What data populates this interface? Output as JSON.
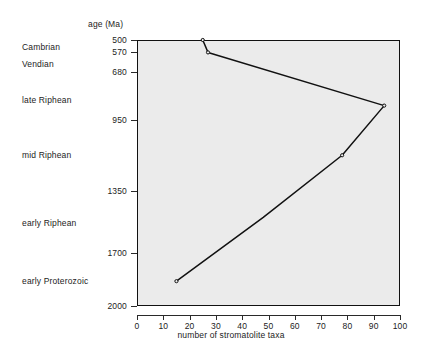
{
  "axes": {
    "y_header": "age (Ma)",
    "x_title": "number of  stromatolite taxa",
    "y_ticks": [
      "500",
      "570",
      "680",
      "950",
      "1350",
      "1700",
      "2000"
    ],
    "x_ticks": [
      "0",
      "10",
      "20",
      "30",
      "40",
      "50",
      "60",
      "70",
      "80",
      "90",
      "100"
    ]
  },
  "era_labels": [
    {
      "label": "Cambrian"
    },
    {
      "label": "Vendian"
    },
    {
      "label": "late Riphean"
    },
    {
      "label": "mid Riphean"
    },
    {
      "label": "early Riphean"
    },
    {
      "label": "early Proterozoic"
    }
  ],
  "chart_data": {
    "type": "line",
    "title": "",
    "xlabel": "number of  stromatolite taxa",
    "ylabel": "age (Ma)",
    "xlim": [
      0,
      100
    ],
    "ylim": [
      2000,
      500
    ],
    "y_inverted": true,
    "grid": false,
    "legend": null,
    "x_tick_values": [
      0,
      10,
      20,
      30,
      40,
      50,
      60,
      70,
      80,
      90,
      100
    ],
    "y_tick_values": [
      500,
      570,
      680,
      950,
      1350,
      1700,
      2000
    ],
    "era_boundaries_ma": [
      500,
      570,
      680,
      950,
      1350,
      1700,
      2000
    ],
    "series": [
      {
        "name": "stromatolite taxa",
        "x": [
          25,
          27,
          94,
          78,
          48,
          15
        ],
        "y": [
          500,
          570,
          870,
          1150,
          1500,
          1860
        ],
        "markers": [
          true,
          true,
          true,
          true,
          false,
          true
        ]
      }
    ],
    "era_label_positions_ma": [
      {
        "label": "Cambrian",
        "age": 540
      },
      {
        "label": "Vendian",
        "age": 635
      },
      {
        "label": "late Riphean",
        "age": 840
      },
      {
        "label": "mid Riphean",
        "age": 1150
      },
      {
        "label": "early Riphean",
        "age": 1530
      },
      {
        "label": "early Proterozoic",
        "age": 1860
      }
    ]
  },
  "geometry": {
    "plot_left": 137,
    "plot_right": 400,
    "plot_top": 40,
    "plot_bottom": 306,
    "era_label_x": 22,
    "ytick_label_right": 131,
    "y_header_x": 88,
    "y_header_y": 19,
    "x_title_y": 330
  },
  "colors": {
    "line": "#111111",
    "plot_background": "#ebebeb",
    "frame": "#111111",
    "text": "#1c1c1c"
  }
}
